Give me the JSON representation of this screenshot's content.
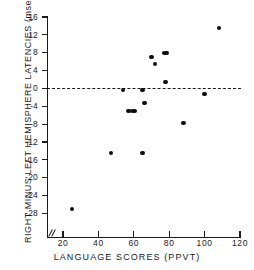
{
  "chart_data": {
    "type": "scatter",
    "title": "",
    "xlabel": "LANGUAGE SCORES (PPVT)",
    "ylabel": "RIGHT MINUS LEFT HEMISPHERE LATENCIES (msec)",
    "xlim": [
      15,
      120
    ],
    "ylim": [
      -30,
      16
    ],
    "xticks": [
      20,
      40,
      60,
      80,
      100,
      120
    ],
    "xticklabels": [
      "20",
      "40",
      "60",
      "80",
      "100",
      "120"
    ],
    "yticks": [
      16,
      12,
      8,
      4,
      0,
      -4,
      -8,
      -12,
      -16,
      -20,
      -24,
      -28
    ],
    "yticklabels": [
      "16",
      "12",
      "8",
      "4",
      "0",
      "-4",
      "-8",
      "-12",
      "-16",
      "-20",
      "-24",
      "-28"
    ],
    "grid": false,
    "legend": null,
    "annotations": [
      {
        "name": "zero-reference-line",
        "type": "hline",
        "y": 0,
        "style": "dashed"
      },
      {
        "name": "x-axis-break",
        "type": "axis-break",
        "x": 17
      }
    ],
    "marker": {
      "shape": "circle",
      "color": "#0d0d0d",
      "size": 4.4
    },
    "points": [
      {
        "x": 25,
        "y": -27.0
      },
      {
        "x": 47,
        "y": -14.5
      },
      {
        "x": 54,
        "y": -0.3
      },
      {
        "x": 57,
        "y": -5.0
      },
      {
        "x": 59,
        "y": -5.0
      },
      {
        "x": 60.5,
        "y": -5.0
      },
      {
        "x": 65,
        "y": -0.3
      },
      {
        "x": 65,
        "y": -14.5
      },
      {
        "x": 66,
        "y": -3.3
      },
      {
        "x": 70,
        "y": 7.0
      },
      {
        "x": 72,
        "y": 5.5
      },
      {
        "x": 77,
        "y": 8.0
      },
      {
        "x": 78.5,
        "y": 8.0
      },
      {
        "x": 78,
        "y": 1.5
      },
      {
        "x": 88,
        "y": -7.7
      },
      {
        "x": 100,
        "y": -1.2
      },
      {
        "x": 108,
        "y": 13.5
      }
    ]
  }
}
